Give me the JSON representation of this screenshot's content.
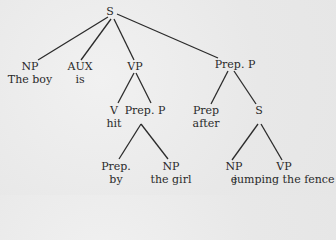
{
  "diagram": {
    "type": "syntax-tree",
    "root": {
      "label": "S",
      "children": [
        {
          "label": "NP",
          "word": "The boy"
        },
        {
          "label": "AUX",
          "word": "is"
        },
        {
          "label": "VP",
          "children": [
            {
              "label": "V",
              "word": "hit"
            },
            {
              "label": "Prep. P",
              "children": [
                {
                  "label": "Prep.",
                  "word": "by"
                },
                {
                  "label": "NP",
                  "word": "the girl"
                }
              ]
            }
          ]
        },
        {
          "label": "Prep. P",
          "children": [
            {
              "label": "Prep",
              "word": "after"
            },
            {
              "label": "S",
              "children": [
                {
                  "label": "NP",
                  "word": "e"
                },
                {
                  "label": "VP",
                  "word": "jumping the fence"
                }
              ]
            }
          ]
        }
      ]
    }
  },
  "nodes": {
    "s_root": {
      "label": "S"
    },
    "np1": {
      "label": "NP",
      "word": "The boy"
    },
    "aux": {
      "label": "AUX",
      "word": "is"
    },
    "vp1": {
      "label": "VP"
    },
    "pp1": {
      "label": "Prep. P"
    },
    "v": {
      "label": "V",
      "word": "hit"
    },
    "pp2": {
      "label": "Prep. P"
    },
    "prep2": {
      "label": "Prep",
      "word": "after"
    },
    "s2": {
      "label": "S"
    },
    "prep1": {
      "label": "Prep.",
      "word": "by"
    },
    "np2": {
      "label": "NP",
      "word": "the girl"
    },
    "np3": {
      "label": "NP",
      "word": "e"
    },
    "vp2": {
      "label": "VP",
      "word": "jumping the fence"
    }
  }
}
